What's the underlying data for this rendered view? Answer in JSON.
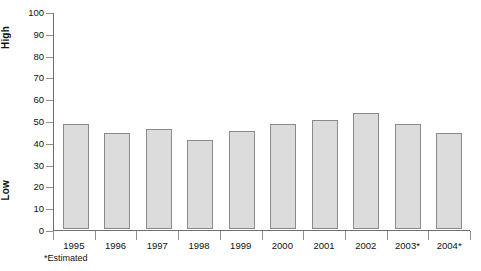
{
  "chart_data": {
    "type": "bar",
    "title": "",
    "subtitle": "",
    "xlabel": "",
    "ylabel": "",
    "categories": [
      "1995",
      "1996",
      "1997",
      "1998",
      "1999",
      "2000",
      "2001",
      "2002",
      "2003*",
      "2004*"
    ],
    "values": [
      48,
      44,
      46,
      41,
      45,
      48,
      50,
      53,
      48,
      44
    ],
    "series": [
      {
        "name": "",
        "values": [
          48,
          44,
          46,
          41,
          45,
          48,
          50,
          53,
          48,
          44
        ]
      }
    ],
    "ylim": [
      0,
      100
    ],
    "ytick_values": [
      0,
      10,
      20,
      30,
      40,
      50,
      60,
      70,
      80,
      90,
      100
    ],
    "ytick_labels": [
      "0",
      "10",
      "20",
      "30",
      "40",
      "50",
      "60",
      "70",
      "80",
      "90",
      "100"
    ],
    "grid": false,
    "legend": "none",
    "annotations": [
      "*Estimated"
    ],
    "axis_captions": {
      "top": "High",
      "bottom": "Low"
    },
    "colors": {
      "bar_fill": "#dcdcdc",
      "bar_border": "#8a8a8a",
      "axis": "#6f6f6f",
      "tick": "#8e8e8e",
      "text": "#111111",
      "background": "#ffffff"
    }
  },
  "footnote": "*Estimated"
}
